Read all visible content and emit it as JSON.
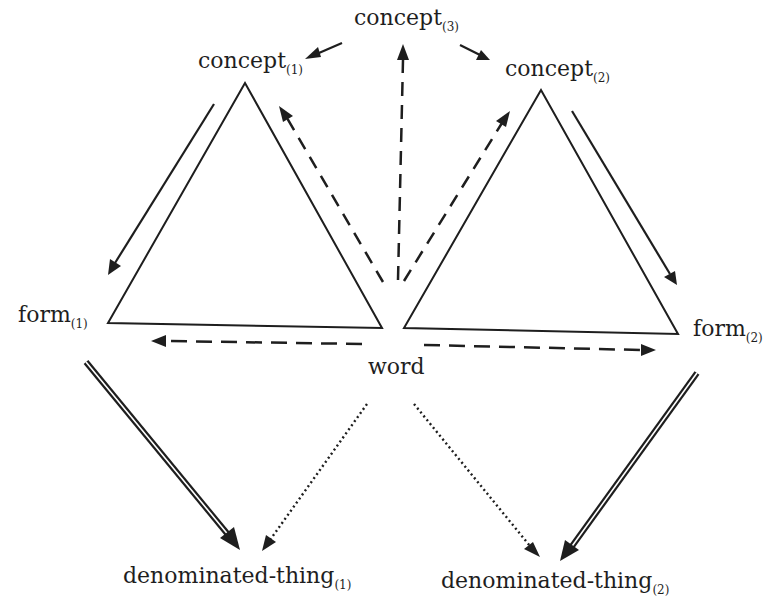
{
  "diagram": {
    "type": "semiotic-triangles",
    "colors": {
      "ink": "#1e1e1e",
      "background": "#ffffff"
    },
    "nodes": {
      "concept3": {
        "text": "concept",
        "sub": "(3)"
      },
      "concept1": {
        "text": "concept",
        "sub": "(1)"
      },
      "concept2": {
        "text": "concept",
        "sub": "(2)"
      },
      "form1": {
        "text": "form",
        "sub": "(1)"
      },
      "form2": {
        "text": "form",
        "sub": "(2)"
      },
      "word": {
        "text": "word",
        "sub": ""
      },
      "thing1": {
        "text": "denominated-thing",
        "sub": "(1)"
      },
      "thing2": {
        "text": "denominated-thing",
        "sub": "(2)"
      }
    },
    "shapes": [
      {
        "name": "triangle-left",
        "vertices": [
          "concept1",
          "form1",
          "word"
        ]
      },
      {
        "name": "triangle-right",
        "vertices": [
          "concept2",
          "word",
          "form2"
        ]
      }
    ],
    "edges": [
      {
        "from": "concept3",
        "to": "concept1",
        "style": "solid"
      },
      {
        "from": "concept3",
        "to": "concept2",
        "style": "solid"
      },
      {
        "from": "word",
        "to": "concept3",
        "style": "dashed"
      },
      {
        "from": "word",
        "to": "concept1",
        "style": "dashed"
      },
      {
        "from": "word",
        "to": "concept2",
        "style": "dashed"
      },
      {
        "from": "concept1",
        "to": "form1",
        "style": "solid"
      },
      {
        "from": "concept2",
        "to": "form2",
        "style": "solid"
      },
      {
        "from": "word",
        "to": "form1",
        "style": "dashed"
      },
      {
        "from": "word",
        "to": "form2",
        "style": "dashed"
      },
      {
        "from": "form1",
        "to": "thing1",
        "style": "double"
      },
      {
        "from": "form2",
        "to": "thing2",
        "style": "double"
      },
      {
        "from": "word",
        "to": "thing1",
        "style": "dotted"
      },
      {
        "from": "word",
        "to": "thing2",
        "style": "dotted"
      }
    ]
  }
}
